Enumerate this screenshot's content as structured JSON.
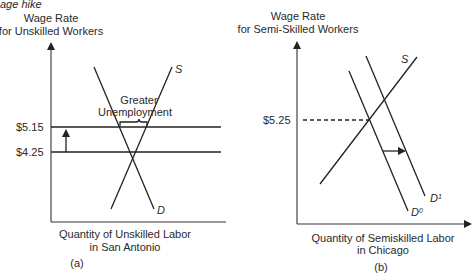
{
  "header_fragment": "age hike",
  "panel_a": {
    "y_axis_label_line1": "Wage Rate",
    "y_axis_label_line2": "for Unskilled Workers",
    "x_axis_label_line1": "Quantity of Unskilled Labor",
    "x_axis_label_line2": "in San Antonio",
    "caption": "(a)",
    "wage_high": "$5.15",
    "wage_low": "$4.25",
    "annotation_line1": "Greater",
    "annotation_line2": "Unemployment",
    "supply_label": "S",
    "demand_label": "D"
  },
  "panel_b": {
    "y_axis_label_line1": "Wage Rate",
    "y_axis_label_line2": "for Semi-Skilled Workers",
    "x_axis_label_line1": "Quantity of Semiskilled Labor",
    "x_axis_label_line2": "in Chicago",
    "caption": "(b)",
    "wage": "$5.25",
    "supply_label": "S",
    "demand0_label": "D",
    "demand0_sup": "0",
    "demand1_label": "D",
    "demand1_sup": "1"
  }
}
